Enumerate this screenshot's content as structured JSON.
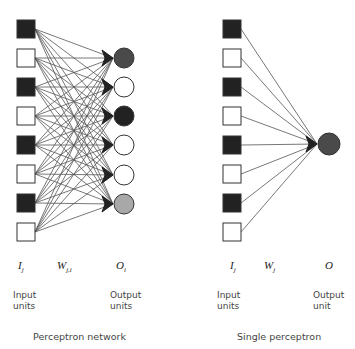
{
  "colors": {
    "filled": "#222222",
    "empty": "#ffffff",
    "stroke": "#333333",
    "line": "#555555",
    "dark_gray": "#4a4a4a",
    "light_gray": "#a8a8a8"
  },
  "left_network": {
    "caption": "Perceptron network",
    "input_symbol": "I",
    "input_sub": "j",
    "weight_symbol": "W",
    "weight_sub": "j,i",
    "output_symbol": "O",
    "output_sub": "i",
    "input_label_line1": "Input",
    "input_label_line2": "units",
    "output_label_line1": "Output",
    "output_label_line2": "units",
    "inputs": [
      {
        "y": 29,
        "fill": "filled"
      },
      {
        "y": 58,
        "fill": "empty"
      },
      {
        "y": 87,
        "fill": "filled"
      },
      {
        "y": 116,
        "fill": "empty"
      },
      {
        "y": 145,
        "fill": "filled"
      },
      {
        "y": 174,
        "fill": "empty"
      },
      {
        "y": 203,
        "fill": "filled"
      },
      {
        "y": 232,
        "fill": "empty"
      }
    ],
    "outputs": [
      {
        "y": 58,
        "fill": "dark_gray"
      },
      {
        "y": 87,
        "fill": "empty"
      },
      {
        "y": 116,
        "fill": "filled"
      },
      {
        "y": 145,
        "fill": "empty"
      },
      {
        "y": 175,
        "fill": "empty"
      },
      {
        "y": 204,
        "fill": "light_gray"
      }
    ],
    "input_x": 26,
    "output_x": 124
  },
  "right_network": {
    "caption": "Single perceptron",
    "input_symbol": "I",
    "input_sub": "j",
    "weight_symbol": "W",
    "weight_sub": "j",
    "output_symbol": "O",
    "input_label_line1": "Input",
    "input_label_line2": "units",
    "output_label_line1": "Output",
    "output_label_line2": "unit",
    "inputs": [
      {
        "y": 29,
        "fill": "filled"
      },
      {
        "y": 58,
        "fill": "empty"
      },
      {
        "y": 87,
        "fill": "filled"
      },
      {
        "y": 116,
        "fill": "empty"
      },
      {
        "y": 145,
        "fill": "filled"
      },
      {
        "y": 174,
        "fill": "empty"
      },
      {
        "y": 203,
        "fill": "filled"
      },
      {
        "y": 232,
        "fill": "empty"
      }
    ],
    "output": {
      "y": 144,
      "fill": "dark_gray"
    },
    "input_x": 232,
    "output_x": 329
  }
}
